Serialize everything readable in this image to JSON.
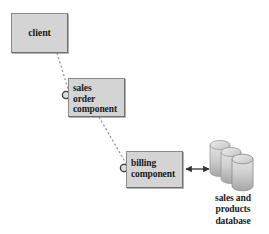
{
  "diagram": {
    "type": "uml-component-diagram",
    "title": "",
    "background_color": "#ffffff",
    "node_fill_color": "#d4d4d4",
    "node_border_color": "#6e6e6e",
    "text_color": "#1a1a1a",
    "connector_color": "#8c8c8c",
    "arrow_color": "#333333",
    "nodes": [
      {
        "id": "client",
        "kind": "component-box",
        "label": "client",
        "lines": [
          "client"
        ],
        "x": 11,
        "y": 13,
        "width": 57,
        "height": 40
      },
      {
        "id": "sales-order-component",
        "kind": "component-box",
        "label": "sales order component",
        "lines": [
          "sales",
          "order",
          "component"
        ],
        "x": 68,
        "y": 78,
        "width": 57,
        "height": 39
      },
      {
        "id": "billing-component",
        "kind": "component-box",
        "label": "billing component",
        "lines": [
          "billing",
          "component"
        ],
        "x": 126,
        "y": 151,
        "width": 57,
        "height": 37
      },
      {
        "id": "sales-and-products-database",
        "kind": "database-cylinder-stack",
        "label": "sales and products database",
        "lines": [
          "sales and",
          "products",
          "database"
        ],
        "cylinder_count": 3,
        "x": 205,
        "y": 136,
        "width": 58,
        "height": 56
      }
    ],
    "sockets": [
      {
        "id": "socket-sales-order",
        "attached_to": "sales-order-component",
        "cx": 66,
        "cy": 95,
        "r": 4
      },
      {
        "id": "socket-billing",
        "attached_to": "billing-component",
        "cx": 124,
        "cy": 168,
        "r": 4
      }
    ],
    "connectors": [
      {
        "id": "client-to-sales-order",
        "style": "dashed",
        "from": "client",
        "to": "socket-sales-order",
        "x1": 57,
        "y1": 53,
        "x2": 70,
        "y2": 93
      },
      {
        "id": "sales-order-to-billing",
        "style": "dashed",
        "from": "sales-order-component",
        "to": "socket-billing",
        "x1": 99,
        "y1": 117,
        "x2": 128,
        "y2": 166
      },
      {
        "id": "billing-to-database",
        "style": "solid",
        "arrowheads": "both",
        "from": "billing-component",
        "to": "sales-and-products-database",
        "x1": 183,
        "y1": 169,
        "x2": 211,
        "y2": 169
      }
    ]
  }
}
